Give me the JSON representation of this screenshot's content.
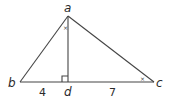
{
  "diagram": {
    "type": "right-triangle-with-altitude",
    "vertices": {
      "a": {
        "label": "a"
      },
      "b": {
        "label": "b"
      },
      "c": {
        "label": "c"
      },
      "d": {
        "label": "d"
      }
    },
    "segments": [
      {
        "from": "a",
        "to": "b"
      },
      {
        "from": "a",
        "to": "c"
      },
      {
        "from": "b",
        "to": "c"
      },
      {
        "from": "a",
        "to": "d",
        "role": "altitude"
      }
    ],
    "lengths": {
      "bd": "4",
      "dc": "7"
    },
    "angle_marks": {
      "bad": "×",
      "acb": "×"
    },
    "right_angle_at": "d"
  }
}
